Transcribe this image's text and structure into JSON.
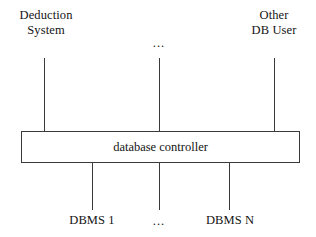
{
  "diagram": {
    "background_color": "#ffffff",
    "line_color": "#3a3a3a",
    "text_color": "#141414",
    "clients": {
      "left": {
        "line1": "Deduction",
        "line2": "System"
      },
      "middle_ellipsis": "...",
      "right": {
        "line1": "Other",
        "line2": "DB User"
      }
    },
    "controller": {
      "label": "database controller"
    },
    "backends": {
      "left": "DBMS 1",
      "middle_ellipsis": "...",
      "right": "DBMS N"
    }
  }
}
